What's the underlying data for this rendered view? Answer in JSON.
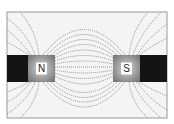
{
  "diagram": {
    "frame": {
      "x": 7,
      "y": 12,
      "w": 160,
      "h": 106
    },
    "colors": {
      "bar": "#141414",
      "pole_light": "#d8d8d8",
      "pole_dark": "#6e6e6e",
      "field_line": "#7a7a7a",
      "background": "#f4f4f4"
    },
    "poles": [
      {
        "label": "N",
        "name": "north-pole",
        "x": 28,
        "y": 55,
        "w": 27,
        "h": 27
      },
      {
        "label": "S",
        "name": "south-pole",
        "x": 113,
        "y": 55,
        "w": 27,
        "h": 27
      }
    ],
    "bars": [
      {
        "name": "left-magnet-bar",
        "x": 7,
        "y": 55,
        "w": 21,
        "h": 27
      },
      {
        "name": "right-magnet-bar",
        "x": 140,
        "y": 55,
        "w": 27,
        "h": 27
      }
    ],
    "field_lines": [
      "M55,67 L113,67",
      "M55,64 Q84,58 113,64",
      "M55,61 Q84,50 113,61",
      "M55,58 Q84,42 113,58",
      "M54,56 Q84,33 114,56",
      "M51,55 Q84,24 117,55",
      "M47,55 Q84,14 121,55",
      "M43,55 Q84,4 125,55",
      "M55,70 Q84,76 113,70",
      "M55,73 Q84,84 113,73",
      "M55,76 Q84,92 113,76",
      "M54,81 Q84,104 114,81",
      "M51,82 Q84,113 117,82",
      "M47,82 Q84,122 121,82",
      "M43,82 Q84,132 125,82",
      "M39,55 Q36,30 20,12",
      "M35,55 Q28,34 7,18",
      "M31,55 Q20,40 7,30",
      "M29,55 Q18,48 7,42",
      "M39,82 Q36,104 20,118",
      "M35,82 Q28,100 7,114",
      "M31,82 Q20,96 7,102",
      "M29,82 Q18,88 7,92",
      "M129,55 Q132,30 148,12",
      "M133,55 Q140,34 161,12",
      "M137,55 Q148,38 167,24",
      "M139,55 Q152,46 167,38",
      "M129,82 Q132,104 148,118",
      "M133,82 Q140,100 161,118",
      "M137,82 Q148,98 167,110",
      "M139,82 Q152,90 167,96"
    ]
  }
}
